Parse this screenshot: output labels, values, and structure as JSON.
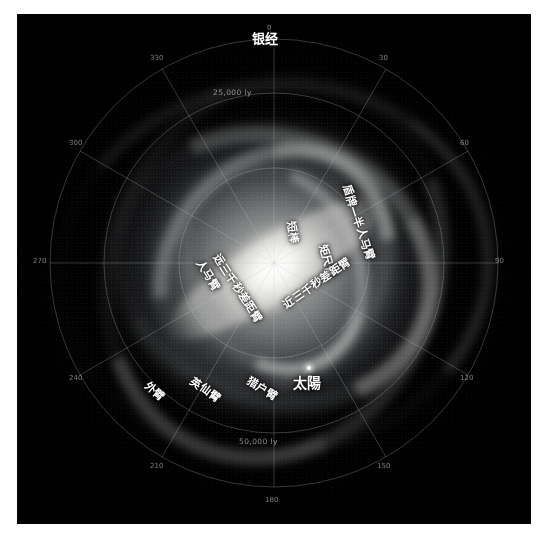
{
  "figure": {
    "title": "银经",
    "background_color": "#000000",
    "page_color": "#ffffff",
    "label_color": "#ffffff",
    "grid_color": "#c6c8cd"
  },
  "axes": {
    "angular_unit": "°",
    "angle_ticks": [
      {
        "label": "0",
        "deg": 0
      },
      {
        "label": "30",
        "deg": 30
      },
      {
        "label": "60",
        "deg": 60
      },
      {
        "label": "90",
        "deg": 90
      },
      {
        "label": "120",
        "deg": 120
      },
      {
        "label": "150",
        "deg": 150
      },
      {
        "label": "180",
        "deg": 180
      },
      {
        "label": "210",
        "deg": 210
      },
      {
        "label": "240",
        "deg": 240
      },
      {
        "label": "270",
        "deg": 270
      },
      {
        "label": "300",
        "deg": 300
      },
      {
        "label": "330",
        "deg": 330
      }
    ],
    "radial_rings": [
      {
        "label": "25,000 ly",
        "value": 25000
      },
      {
        "label": "50,000 ly",
        "value": 50000
      }
    ]
  },
  "annotations": [
    {
      "name": "scutum-centaurus-arm",
      "text": "盾牌—半人马臂"
    },
    {
      "name": "norma-arm",
      "text": "矩尺臂"
    },
    {
      "name": "short-bar",
      "text": "短棒"
    },
    {
      "name": "sagittarius-arm",
      "text": "人马臂"
    },
    {
      "name": "far-3kpc-arm",
      "text": "远三千秒差距臂"
    },
    {
      "name": "near-3kpc-arm",
      "text": "近三千秒差距臂"
    },
    {
      "name": "outer-arm",
      "text": "外臂"
    },
    {
      "name": "perseus-arm",
      "text": "英仙臂"
    },
    {
      "name": "orion-arm",
      "text": "猎户臂"
    },
    {
      "name": "sun",
      "text": "太陽"
    }
  ]
}
